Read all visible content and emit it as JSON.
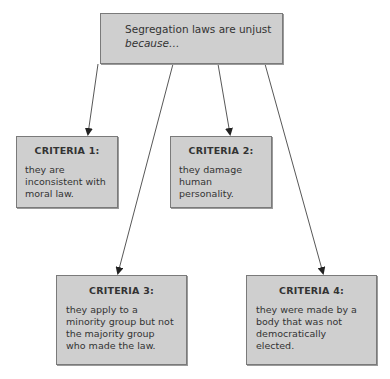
{
  "root": {
    "line1": "Segregation laws are unjust",
    "line2": "because…"
  },
  "criteria": [
    {
      "title": "CRITERIA 1:",
      "text": "they are inconsistent with moral law."
    },
    {
      "title": "CRITERIA 2:",
      "text": "they damage human personality."
    },
    {
      "title": "CRITERIA 3:",
      "text": "they apply to a minority group but not the majority group who made the law."
    },
    {
      "title": "CRITERIA 4:",
      "text": "they were made by a body that was not democratically elected."
    }
  ],
  "colors": {
    "box_fill": "#cfcfcf",
    "box_border": "#7a7a7a",
    "arrow": "#333333"
  }
}
